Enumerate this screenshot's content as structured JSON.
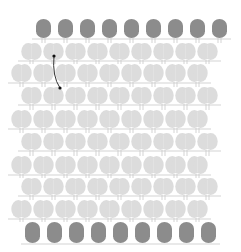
{
  "diagram": {
    "type": "lattice",
    "colors": {
      "background": "#ffffff",
      "dark_node": "#8c8c8c",
      "light_node": "#dcdcdc",
      "connector": "#c8c8c8",
      "arrow": "#333333"
    },
    "rows": [
      {
        "kind": "dark",
        "y": 19,
        "h": 19,
        "x0": 36,
        "count": 9,
        "w": 15
      },
      {
        "kind": "light",
        "y": 43,
        "h": 17,
        "x0": 22,
        "count": 9,
        "w": 19
      },
      {
        "kind": "light",
        "y": 64,
        "h": 18,
        "x0": 12,
        "count": 9,
        "w": 19
      },
      {
        "kind": "light",
        "y": 87,
        "h": 17,
        "x0": 22,
        "count": 9,
        "w": 19
      },
      {
        "kind": "light",
        "y": 110,
        "h": 18,
        "x0": 12,
        "count": 9,
        "w": 19
      },
      {
        "kind": "light",
        "y": 133,
        "h": 17,
        "x0": 22,
        "count": 9,
        "w": 19
      },
      {
        "kind": "light",
        "y": 156,
        "h": 18,
        "x0": 12,
        "count": 9,
        "w": 19
      },
      {
        "kind": "light",
        "y": 178,
        "h": 17,
        "x0": 22,
        "count": 9,
        "w": 19
      },
      {
        "kind": "light",
        "y": 200,
        "h": 18,
        "x0": 12,
        "count": 9,
        "w": 19
      },
      {
        "kind": "dark",
        "y": 222,
        "h": 21,
        "x0": 25,
        "count": 9,
        "w": 15
      }
    ],
    "spacing": 22,
    "arrow": {
      "start": [
        54,
        56
      ],
      "control": [
        52,
        76
      ],
      "end": [
        60,
        88
      ]
    }
  }
}
